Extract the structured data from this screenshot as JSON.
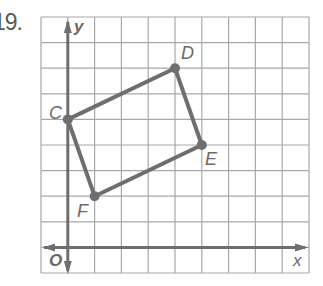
{
  "problem": {
    "number": "19."
  },
  "graph": {
    "grid": {
      "columns": 10,
      "rows": 10,
      "x_min": -1,
      "x_max": 9,
      "y_min": -1,
      "y_max": 9
    },
    "axes": {
      "x_label": "x",
      "y_label": "y",
      "origin_label": "O"
    },
    "points": [
      {
        "name": "C",
        "x": 0,
        "y": 5
      },
      {
        "name": "D",
        "x": 4,
        "y": 7
      },
      {
        "name": "E",
        "x": 5,
        "y": 4
      },
      {
        "name": "F",
        "x": 1,
        "y": 2
      }
    ],
    "polygon": [
      "C",
      "D",
      "E",
      "F"
    ],
    "colors": {
      "grid": "#a8a8a8",
      "axis": "#6e6e6e",
      "shape": "#6e6e6e",
      "label": "#6a6a6a"
    }
  }
}
